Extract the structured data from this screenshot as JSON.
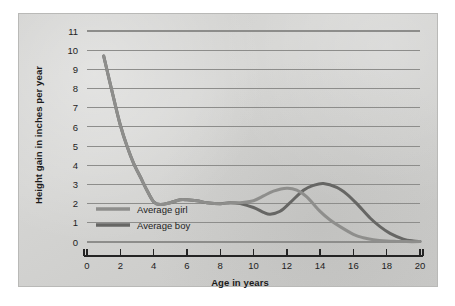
{
  "chart_data": {
    "type": "line",
    "title": "",
    "xlabel": "Age in years",
    "ylabel": "Height gain in inches per year",
    "xlim": [
      0,
      20
    ],
    "ylim": [
      0,
      11
    ],
    "xticks": [
      "0",
      "2",
      "4",
      "6",
      "8",
      "10",
      "12",
      "14",
      "16",
      "18",
      "20"
    ],
    "yticks": [
      "0",
      "1",
      "2",
      "3",
      "4",
      "5",
      "6",
      "7",
      "8",
      "9",
      "10",
      "11"
    ],
    "grid": "horizontal",
    "legend_position": "inside-lower-left",
    "series": [
      {
        "name": "Average girl",
        "color": "#8e8e8c",
        "x": [
          1.0,
          1.3,
          1.6,
          2.0,
          2.4,
          2.8,
          3.2,
          3.6,
          4.0,
          4.4,
          5.0,
          5.6,
          6.0,
          6.6,
          7.2,
          8.0,
          8.6,
          9.2,
          10.0,
          10.6,
          11.2,
          12.0,
          12.6,
          13.2,
          14.0,
          14.6,
          15.2,
          16.0,
          16.6,
          17.2,
          18.0,
          18.6,
          19.2,
          20.0
        ],
        "values": [
          9.7,
          8.6,
          7.5,
          6.1,
          5.0,
          4.1,
          3.4,
          2.7,
          2.1,
          1.95,
          2.05,
          2.2,
          2.2,
          2.15,
          2.05,
          2.0,
          2.05,
          2.05,
          2.15,
          2.4,
          2.65,
          2.8,
          2.7,
          2.35,
          1.6,
          1.15,
          0.8,
          0.4,
          0.22,
          0.12,
          0.05,
          0.03,
          0.02,
          0.02
        ]
      },
      {
        "name": "Average boy",
        "color": "#666664",
        "x": [
          1.0,
          1.3,
          1.6,
          2.0,
          2.4,
          2.8,
          3.2,
          3.6,
          4.0,
          4.4,
          5.0,
          5.6,
          6.0,
          6.6,
          7.2,
          8.0,
          8.6,
          9.2,
          10.0,
          10.6,
          11.0,
          11.6,
          12.2,
          13.0,
          13.6,
          14.2,
          15.0,
          15.6,
          16.2,
          17.0,
          17.6,
          18.2,
          19.0,
          19.6,
          20.0
        ],
        "values": [
          9.7,
          8.6,
          7.5,
          6.1,
          5.0,
          4.1,
          3.4,
          2.7,
          2.1,
          1.95,
          2.05,
          2.2,
          2.2,
          2.15,
          2.05,
          2.0,
          2.05,
          2.0,
          1.8,
          1.55,
          1.45,
          1.6,
          2.05,
          2.7,
          2.95,
          3.05,
          2.85,
          2.5,
          2.0,
          1.25,
          0.8,
          0.45,
          0.15,
          0.05,
          0.03
        ]
      }
    ]
  },
  "legend": {
    "items": [
      {
        "label": "Average girl",
        "color": "#8e8e8c"
      },
      {
        "label": "Average boy",
        "color": "#666664"
      }
    ]
  }
}
